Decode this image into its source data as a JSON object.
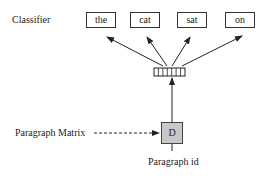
{
  "diagram": {
    "labels": {
      "classifier": "Classifier",
      "paragraph_matrix": "Paragraph Matrix",
      "paragraph_id": "Paragraph id"
    },
    "words": [
      "the",
      "cat",
      "sat",
      "on"
    ],
    "paragraph_token": "D",
    "vector_cells": 7,
    "colors": {
      "line": "#222222",
      "paragraph_box_fill": "#c8c8c8",
      "background": "#ffffff"
    }
  }
}
